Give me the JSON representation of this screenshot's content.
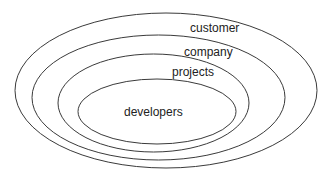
{
  "diagram": {
    "type": "nested-ellipses",
    "stroke_color": "#3a3a3a",
    "layers": [
      {
        "label": "customer",
        "ellipse": {
          "cx": 166,
          "cy": 90.5,
          "rx": 151,
          "ry": 77.5
        },
        "label_pos": {
          "x": 190,
          "y": 32
        }
      },
      {
        "label": "company",
        "ellipse": {
          "cx": 158.5,
          "cy": 97.5,
          "rx": 126.5,
          "ry": 62.5
        },
        "label_pos": {
          "x": 184,
          "y": 56
        }
      },
      {
        "label": "projects",
        "ellipse": {
          "cx": 153.5,
          "cy": 103,
          "rx": 95.5,
          "ry": 49
        },
        "label_pos": {
          "x": 172,
          "y": 76
        }
      },
      {
        "label": "developers",
        "ellipse": {
          "cx": 157,
          "cy": 111.5,
          "rx": 79,
          "ry": 32.5
        },
        "label_pos": {
          "x": 124,
          "y": 116
        }
      }
    ]
  }
}
